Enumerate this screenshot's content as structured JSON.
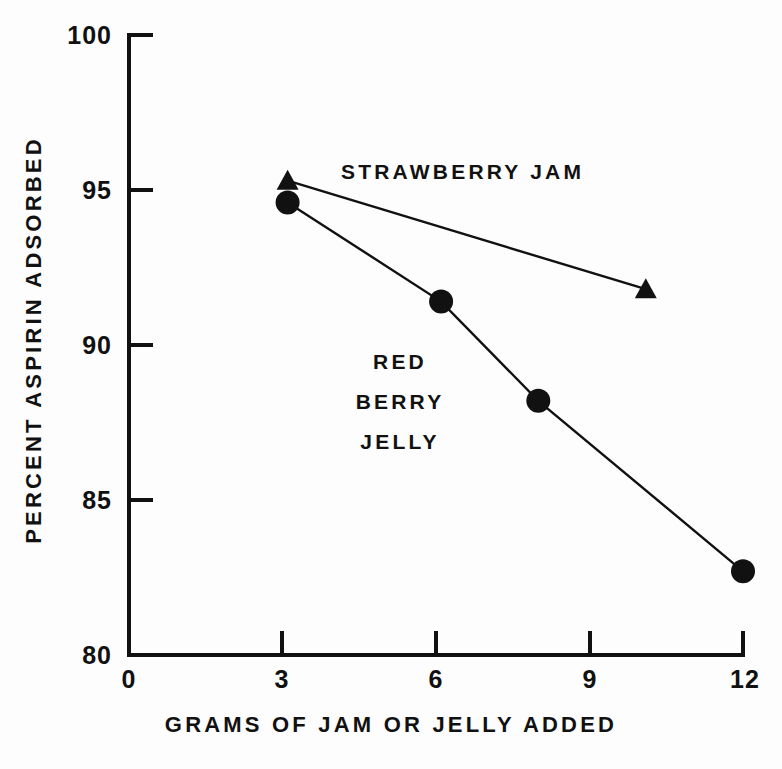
{
  "chart_data": {
    "type": "line",
    "title": "",
    "xlabel": "GRAMS OF JAM OR JELLY ADDED",
    "ylabel": "PERCENT ASPIRIN ADSORBED",
    "xlim": [
      0,
      12
    ],
    "ylim": [
      80,
      100
    ],
    "xticks": [
      0,
      3,
      6,
      9,
      12
    ],
    "xtick_labels": [
      "0",
      "3",
      "6",
      "9",
      "12"
    ],
    "yticks": [
      80,
      85,
      90,
      95,
      100
    ],
    "ytick_labels": [
      "80",
      "85",
      "90",
      "95",
      "100"
    ],
    "grid": false,
    "legend": "inline-annotations",
    "series": [
      {
        "name": "STRAWBERRY JAM",
        "marker": "triangle",
        "color": "#111111",
        "x": [
          3.1,
          10.1
        ],
        "values": [
          95.3,
          91.8
        ]
      },
      {
        "name": "RED BERRY JELLY",
        "marker": "circle",
        "color": "#111111",
        "x": [
          3.1,
          6.1,
          8.0,
          12.0
        ],
        "values": [
          94.6,
          91.4,
          88.2,
          82.7
        ]
      }
    ],
    "annotations": [
      {
        "text": "STRAWBERRY JAM",
        "x": 7.1,
        "y": 95.5
      },
      {
        "text": "RED",
        "x": 5.3,
        "y": 89.8
      },
      {
        "text": "BERRY",
        "x": 5.3,
        "y": 88.5
      },
      {
        "text": "JELLY",
        "x": 5.3,
        "y": 87.2
      }
    ]
  },
  "axes": {
    "y_tick_labels": [
      "100",
      "95",
      "90",
      "85",
      "80"
    ],
    "x_tick_labels": [
      "0",
      "3",
      "6",
      "9",
      "12"
    ],
    "x_title": "GRAMS OF JAM OR JELLY ADDED",
    "y_title": "PERCENT ASPIRIN ADSORBED"
  },
  "labels": {
    "strawberry_jam": "STRAWBERRY JAM",
    "jelly_line1": "RED",
    "jelly_line2": "BERRY",
    "jelly_line3": "JELLY"
  },
  "colors": {
    "ink": "#111111",
    "background": "#fdfdfd"
  }
}
